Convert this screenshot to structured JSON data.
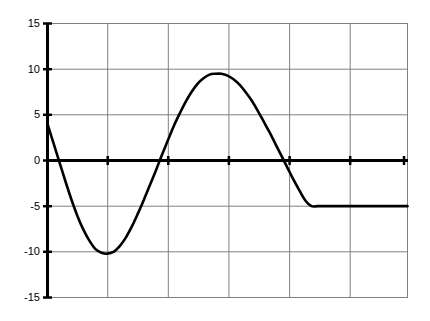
{
  "chart_data": {
    "type": "line",
    "title": "",
    "subtitle": "",
    "xlabel": "",
    "ylabel": "",
    "grid": true,
    "legend": false,
    "legend_position": "none",
    "xlim": [
      0,
      6
    ],
    "ylim": [
      -15,
      15
    ],
    "y_ticks": [
      15,
      10,
      5,
      0,
      -5,
      -10,
      -15
    ],
    "y_tick_labels": [
      "15",
      "10",
      "5",
      "0",
      "-5",
      "-10",
      "-15"
    ],
    "x_ticks": [
      0,
      1,
      2,
      3,
      4,
      5,
      6
    ],
    "x_tick_labels": [
      "",
      "",
      "",
      "",
      "",
      "",
      ""
    ],
    "series": [
      {
        "name": "curve",
        "color": "#000000",
        "x": [
          0.0,
          0.1,
          0.2,
          0.3,
          0.4,
          0.5,
          0.6,
          0.7,
          0.8,
          0.9,
          1.0,
          1.1,
          1.2,
          1.3,
          1.4,
          1.5,
          1.6,
          1.7,
          1.8,
          1.9,
          2.0,
          2.1,
          2.2,
          2.3,
          2.4,
          2.5,
          2.6,
          2.7,
          2.8,
          2.9,
          3.0,
          3.1,
          3.2,
          3.3,
          3.4,
          3.5,
          3.6,
          3.7,
          3.8,
          3.9,
          4.0,
          4.1,
          4.2,
          4.3,
          4.4,
          4.5,
          4.6,
          4.7,
          4.8,
          4.9,
          5.0,
          5.1,
          5.2,
          5.3,
          5.4,
          5.5,
          5.6,
          5.7,
          5.8,
          5.9,
          6.0
        ],
        "y": [
          4.0,
          1.9,
          -0.2,
          -2.3,
          -4.3,
          -6.1,
          -7.6,
          -8.8,
          -9.7,
          -10.1,
          -10.2,
          -10.0,
          -9.4,
          -8.5,
          -7.3,
          -5.9,
          -4.4,
          -2.8,
          -1.2,
          0.5,
          2.1,
          3.7,
          5.1,
          6.4,
          7.5,
          8.4,
          9.0,
          9.4,
          9.5,
          9.5,
          9.3,
          8.9,
          8.3,
          7.5,
          6.6,
          5.5,
          4.3,
          3.1,
          1.8,
          0.5,
          -0.8,
          -2.1,
          -3.3,
          -4.4,
          -5.0,
          -5.0,
          -5.0,
          -5.0,
          -5.0,
          -5.0,
          -5.0,
          -5.0,
          -5.0,
          -5.0,
          -5.0,
          -5.0,
          -5.0,
          -5.0,
          -5.0,
          -5.0,
          -5.0
        ]
      }
    ],
    "key_points": {
      "start_value": 4.0,
      "minimum_value": -10.2,
      "maximum_value": 9.5,
      "end_value": -5.0
    }
  }
}
